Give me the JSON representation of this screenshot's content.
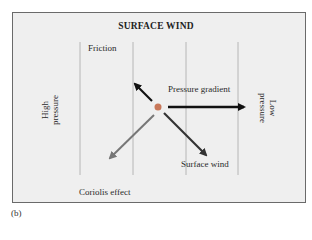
{
  "diagram": {
    "title": "SURFACE WIND",
    "figure_label": "(b)",
    "left_label": {
      "line1": "High",
      "line2": "pressure"
    },
    "right_label": {
      "line1": "Low",
      "line2": "pressure"
    },
    "forces": [
      {
        "name": "Friction",
        "direction": "up-left",
        "color": "#111111"
      },
      {
        "name": "Pressure gradient",
        "direction": "right",
        "color": "#111111"
      },
      {
        "name": "Surface wind",
        "direction": "down-right",
        "color": "#333333"
      },
      {
        "name": "Coriolis effect",
        "direction": "down-left",
        "color": "#777777"
      }
    ],
    "center_dot_color": "#c8785a",
    "isobar_count": 4
  }
}
